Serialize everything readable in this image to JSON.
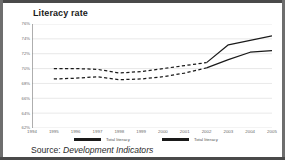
{
  "figure": {
    "title": "Literacy rate",
    "source_label": "Source:",
    "source_value": "Development Indicators"
  },
  "legend": {
    "entries": [
      {
        "label": "Total literacy"
      },
      {
        "label": "Total literacy"
      }
    ]
  },
  "colors": {
    "line": "#1a1a1a",
    "grid": "#d9d9d9",
    "axis": "#9a9a9a",
    "tick_text": "#6b6b6b",
    "title_text": "#1a1a1a",
    "frame": "#4a4a4a"
  },
  "chart_data": {
    "type": "line",
    "title": "Literacy rate",
    "xlabel": "",
    "ylabel": "",
    "grid": true,
    "legend_position": "bottom",
    "xlim": [
      1994,
      2005
    ],
    "ylim": [
      62,
      76
    ],
    "yticks": [
      76,
      74,
      72,
      70,
      68,
      66,
      64,
      62
    ],
    "ytick_labels": [
      "76%",
      "74%",
      "72%",
      "70%",
      "68%",
      "66%",
      "64%",
      "62%"
    ],
    "x": [
      1994,
      1995,
      1996,
      1997,
      1998,
      1999,
      2000,
      2001,
      2002,
      2003,
      2004,
      2005
    ],
    "xtick_labels": [
      "1994",
      "1995",
      "1996",
      "1997",
      "1998",
      "1999",
      "2000",
      "2001",
      "2002",
      "2003",
      "2004",
      "2005"
    ],
    "series": [
      {
        "name": "Total literacy",
        "style": "upper",
        "dashed_until": 2002,
        "values": [
          null,
          70.0,
          70.0,
          69.9,
          69.4,
          69.6,
          70.0,
          70.4,
          70.8,
          73.2,
          73.8,
          74.4
        ]
      },
      {
        "name": "Total literacy",
        "style": "lower",
        "dashed_until": 2002,
        "values": [
          null,
          68.6,
          68.7,
          68.9,
          68.5,
          68.6,
          68.9,
          69.4,
          70.1,
          71.2,
          72.2,
          72.4
        ]
      }
    ]
  }
}
